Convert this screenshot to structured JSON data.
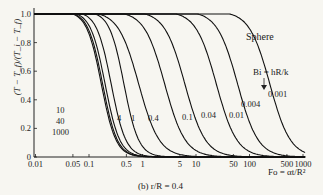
{
  "chart_data": {
    "type": "line",
    "title": "Sphere",
    "subtitle": "(b) r/R = 0.4",
    "xlabel": "Fo = αt/R²",
    "ylabel": "(T − T_f)/(T_i − T_f)",
    "xscale": "log",
    "xlim": [
      0.006,
      1000
    ],
    "ylim": [
      0,
      1.0
    ],
    "xticks": [
      "0.01",
      "0.05",
      "0.1",
      "0.5",
      "1",
      "5",
      "10",
      "50",
      "100",
      "500",
      "1000"
    ],
    "yticks": [
      "0",
      "0.2",
      "0.4",
      "0.6",
      "0.8",
      "1.0"
    ],
    "legend_label": "Bi = hR/k",
    "series": [
      {
        "name": "1000",
        "Fo_at_half": 0.17
      },
      {
        "name": "40",
        "Fo_at_half": 0.18
      },
      {
        "name": "10",
        "Fo_at_half": 0.2
      },
      {
        "name": "4",
        "Fo_at_half": 0.26
      },
      {
        "name": "1",
        "Fo_at_half": 0.45
      },
      {
        "name": "0.4",
        "Fo_at_half": 0.85
      },
      {
        "name": "0.1",
        "Fo_at_half": 2.6
      },
      {
        "name": "0.04",
        "Fo_at_half": 6.2
      },
      {
        "name": "0.01",
        "Fo_at_half": 24
      },
      {
        "name": "0.004",
        "Fo_at_half": 60
      },
      {
        "name": "0.001",
        "Fo_at_half": 240
      }
    ],
    "grid": false
  },
  "labels": {
    "title": "Sphere",
    "bi": "Bi = hR/k",
    "caption": "(b)  r/R = 0.4",
    "xlabel": "Fo = αt/R²",
    "ylabel": "(T − T_f)/(T_i − T_f)"
  }
}
